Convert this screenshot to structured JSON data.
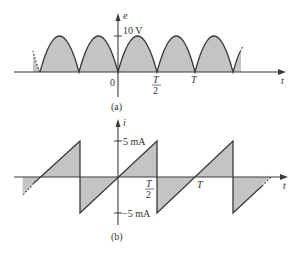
{
  "colors": {
    "fill": "#c4c4c4",
    "stroke": "#3a3a3a",
    "axis": "#3a3a3a",
    "text": "#333333"
  },
  "panel_a": {
    "caption": "(a)",
    "y_axis_label": "e",
    "x_axis_label": "t",
    "peak_label": "10 V",
    "origin_label": "0",
    "half_period_num": "T",
    "half_period_den": "2",
    "period_label": "T",
    "waveform": "full-wave rectified sine",
    "peak_value": 10,
    "peak_unit": "V"
  },
  "panel_b": {
    "caption": "(b)",
    "y_axis_label": "i",
    "x_axis_label": "t",
    "pos_label": "5 mA",
    "neg_label": "−5 mA",
    "half_period_num": "T",
    "half_period_den": "2",
    "period_label": "T",
    "waveform": "sawtooth",
    "peak_value": 5,
    "peak_unit": "mA"
  }
}
